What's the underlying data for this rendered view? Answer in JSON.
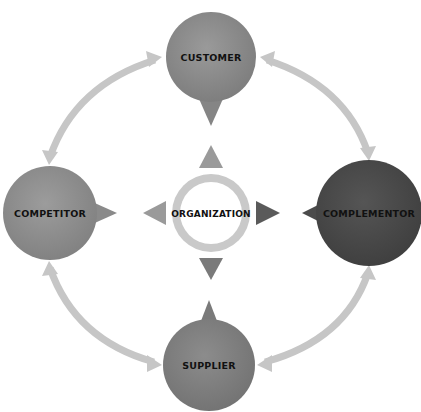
{
  "diagram": {
    "center": {
      "label": "ORGANIZATION",
      "ring_color": "#c9c9c9",
      "pointer_colors": {
        "up": "#9a9a9a",
        "left": "#9a9a9a",
        "right": "#5a5a5a",
        "down": "#7a7a7a"
      }
    },
    "nodes": [
      {
        "id": "customer",
        "label": "CUSTOMER",
        "position": "top",
        "color": "#8c8c8c"
      },
      {
        "id": "competitor",
        "label": "COMPETITOR",
        "position": "left",
        "color": "#8f8f8f"
      },
      {
        "id": "complementor",
        "label": "COMPLEMENTOR",
        "position": "right",
        "color": "#4b4b4b"
      },
      {
        "id": "supplier",
        "label": "SUPPLIER",
        "position": "bottom",
        "color": "#7f7f7f"
      }
    ],
    "connectors": [
      {
        "from": "customer",
        "to": "competitor",
        "type": "double-arrow-arc"
      },
      {
        "from": "customer",
        "to": "complementor",
        "type": "double-arrow-arc"
      },
      {
        "from": "competitor",
        "to": "supplier",
        "type": "double-arrow-arc"
      },
      {
        "from": "complementor",
        "to": "supplier",
        "type": "double-arrow-arc"
      }
    ],
    "arc_color": "#c6c6c6",
    "text_color": "#111111"
  }
}
